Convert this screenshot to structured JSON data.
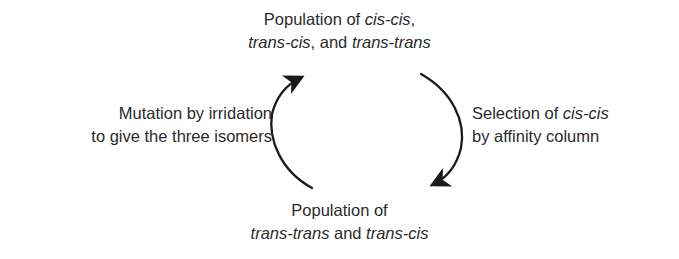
{
  "figure": {
    "type": "cyclic-process-diagram",
    "background_color": "#ffffff",
    "text_color": "#2b2b2b",
    "stroke_color": "#1a1a1a"
  },
  "labels": {
    "top": {
      "name": "population-of-all-three-isomers",
      "line1_plain": "Population of ",
      "line1_italic": "cis-cis",
      "line1_tail": ",",
      "line2_italic_a": "trans-cis",
      "line2_mid": ", and ",
      "line2_italic_b": "trans-trans"
    },
    "right": {
      "name": "selection-step",
      "line1_plain": "Selection of ",
      "line1_italic": "cis-cis",
      "line2_plain": "by affinity column"
    },
    "bottom": {
      "name": "population-after-selection",
      "line1_plain": "Population of",
      "line2_italic_a": "trans-trans",
      "line2_mid": " and ",
      "line2_italic_b": "trans-cis"
    },
    "left": {
      "name": "mutation-step",
      "line1_plain": "Mutation by irridation",
      "line2_plain": "to give the three isomers"
    }
  },
  "arrows": {
    "right_arc": {
      "name": "selection-arrow",
      "direction": "clockwise-downward",
      "from": "top-population",
      "to": "bottom-population"
    },
    "left_arc": {
      "name": "mutation-arrow",
      "direction": "clockwise-upward",
      "from": "bottom-population",
      "to": "top-population"
    }
  }
}
